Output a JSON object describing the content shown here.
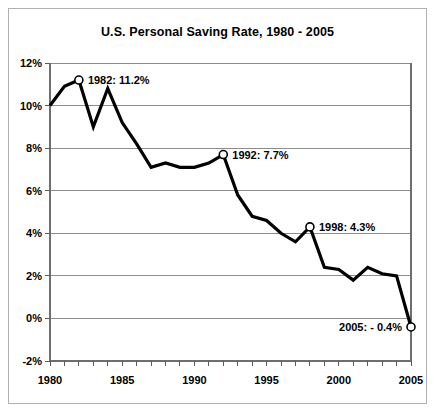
{
  "chart_data": {
    "type": "line",
    "title": "U.S. Personal Saving Rate, 1980 - 2005",
    "xlabel": "",
    "ylabel": "",
    "xlim": [
      1980,
      2005
    ],
    "ylim": [
      -2,
      12
    ],
    "grid": true,
    "legend": "none",
    "x": [
      1980,
      1981,
      1982,
      1983,
      1984,
      1985,
      1986,
      1987,
      1988,
      1989,
      1990,
      1991,
      1992,
      1993,
      1994,
      1995,
      1996,
      1997,
      1998,
      1999,
      2000,
      2001,
      2002,
      2003,
      2004,
      2005
    ],
    "values": [
      10.0,
      10.9,
      11.2,
      9.0,
      10.8,
      9.2,
      8.2,
      7.1,
      7.3,
      7.1,
      7.1,
      7.3,
      7.7,
      5.8,
      4.8,
      4.6,
      4.0,
      3.6,
      4.3,
      2.4,
      2.3,
      1.8,
      2.4,
      2.1,
      2.0,
      -0.4
    ],
    "y_ticks": [
      {
        "value": 12,
        "label": "12%"
      },
      {
        "value": 10,
        "label": "10%"
      },
      {
        "value": 8,
        "label": "8%"
      },
      {
        "value": 6,
        "label": "6%"
      },
      {
        "value": 4,
        "label": "4%"
      },
      {
        "value": 2,
        "label": "2%"
      },
      {
        "value": 0,
        "label": "0%"
      },
      {
        "value": -2,
        "label": "-2%"
      }
    ],
    "x_ticks": [
      {
        "value": 1980,
        "label": "1980"
      },
      {
        "value": 1985,
        "label": "1985"
      },
      {
        "value": 1990,
        "label": "1990"
      },
      {
        "value": 1995,
        "label": "1995"
      },
      {
        "value": 2000,
        "label": "2000"
      },
      {
        "value": 2005,
        "label": "2005"
      }
    ],
    "x_minor_tick_interval": 1,
    "annotations": [
      {
        "x": 1982,
        "y": 11.2,
        "label": "1982: 11.2%",
        "anchor": "left",
        "marker": true
      },
      {
        "x": 1992,
        "y": 7.7,
        "label": "1992: 7.7%",
        "anchor": "left",
        "marker": true
      },
      {
        "x": 1998,
        "y": 4.3,
        "label": "1998: 4.3%",
        "anchor": "left",
        "marker": true
      },
      {
        "x": 2005,
        "y": -0.4,
        "label": "2005: - 0.4%",
        "anchor": "right",
        "marker": true
      }
    ],
    "colors": {
      "line": "#000000",
      "marker_fill": "#ffffff",
      "grid": "#8c8c8c",
      "background": "#ffffff",
      "text": "#000000",
      "border": "#b0b0b0"
    }
  }
}
